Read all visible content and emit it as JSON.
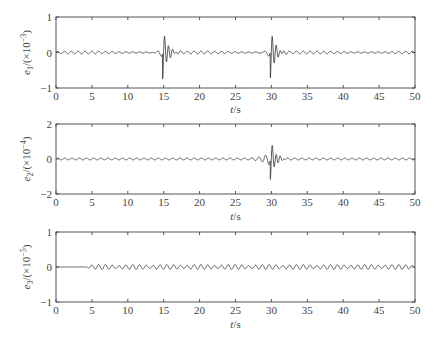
{
  "chart_data": [
    {
      "type": "line",
      "title": "",
      "xlabel": "t/s",
      "ylabel": "e1/(×10^-3)",
      "ylabel_parts": {
        "var": "e",
        "sub": "1",
        "scale": "/(×10",
        "exp": "−3",
        "close": ")"
      },
      "xlim": [
        0,
        50
      ],
      "ylim": [
        -1,
        1
      ],
      "xticks": [
        0,
        5,
        10,
        15,
        20,
        25,
        30,
        35,
        40,
        45,
        50
      ],
      "yticks": [
        -1,
        0,
        1
      ],
      "grid": false,
      "series": [
        {
          "name": "e1",
          "description": "small oscillation (~±0.04) with sharp transient spikes at t=15 (peak ≈0.75, trough ≈−0.68) and t=30 (peak ≈0.75, trough ≈−0.68), decaying ringing after each",
          "baseline_amp": 0.04,
          "events": [
            {
              "t": 15,
              "peak": 0.75,
              "trough": -0.68
            },
            {
              "t": 30,
              "peak": 0.75,
              "trough": -0.68
            }
          ]
        }
      ]
    },
    {
      "type": "line",
      "title": "",
      "xlabel": "t/s",
      "ylabel": "e2/(×10^-4)",
      "ylabel_parts": {
        "var": "e",
        "sub": "2",
        "scale": "/(×10",
        "exp": "−4",
        "close": ")"
      },
      "xlim": [
        0,
        50
      ],
      "ylim": [
        -2,
        2
      ],
      "xticks": [
        0,
        5,
        10,
        15,
        20,
        25,
        30,
        35,
        40,
        45,
        50
      ],
      "yticks": [
        -2,
        0,
        2
      ],
      "grid": false,
      "series": [
        {
          "name": "e2",
          "description": "nearly flat near zero (~±0.05) with a single transient at t=30 (peak ≈1.2, trough ≈−1.1) and decaying ringing",
          "baseline_amp": 0.05,
          "events": [
            {
              "t": 30,
              "peak": 1.2,
              "trough": -1.1
            }
          ]
        }
      ]
    },
    {
      "type": "line",
      "title": "",
      "xlabel": "t/s",
      "ylabel": "e3/(×10^-5)",
      "ylabel_parts": {
        "var": "e",
        "sub": "3",
        "scale": "/(×10",
        "exp": "−5",
        "close": ")"
      },
      "xlim": [
        0,
        50
      ],
      "ylim": [
        -1,
        1
      ],
      "xticks": [
        0,
        5,
        10,
        15,
        20,
        25,
        30,
        35,
        40,
        45,
        50
      ],
      "yticks": [
        -1,
        0,
        1
      ],
      "grid": false,
      "series": [
        {
          "name": "e3",
          "description": "flat until t≈4, then persistent beating oscillation with amplitude ≈±0.07 through t=50",
          "baseline_amp": 0.07,
          "events": []
        }
      ]
    }
  ]
}
